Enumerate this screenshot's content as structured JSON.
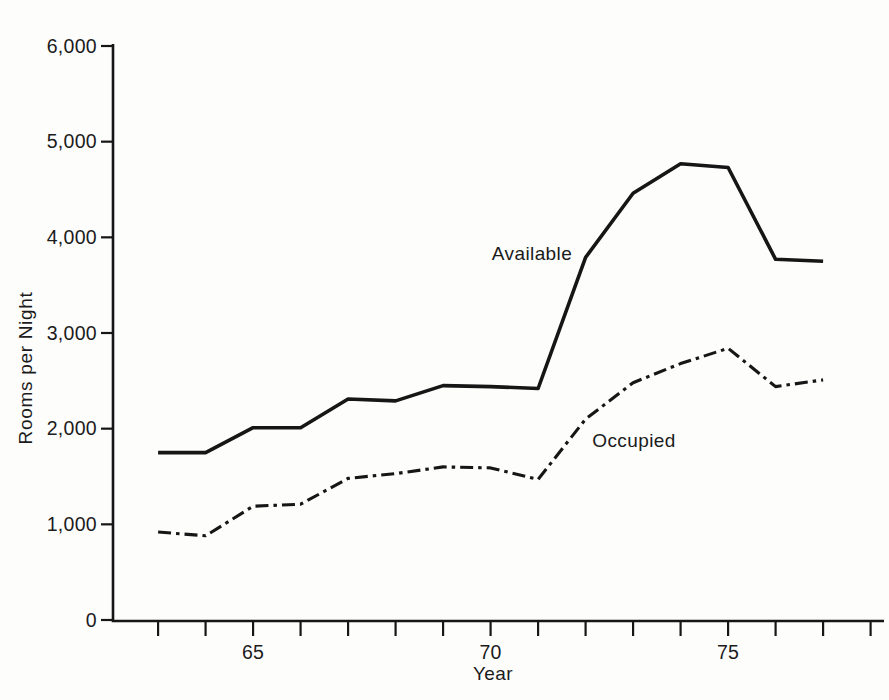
{
  "chart_data": {
    "type": "line",
    "xlabel": "Year",
    "ylabel": "Rooms per Night",
    "x": [
      63,
      64,
      65,
      66,
      67,
      68,
      69,
      70,
      71,
      72,
      73,
      74,
      75,
      76,
      77
    ],
    "series": [
      {
        "name": "Available",
        "style": "solid",
        "values": [
          1750,
          1750,
          2010,
          2010,
          2310,
          2290,
          2450,
          2440,
          2420,
          3790,
          4460,
          4770,
          4730,
          3770,
          3750
        ]
      },
      {
        "name": "Occupied",
        "style": "dash-dot",
        "values": [
          920,
          880,
          1190,
          1210,
          1480,
          1530,
          1600,
          1590,
          1470,
          2100,
          2480,
          2680,
          2840,
          2440,
          2510
        ]
      }
    ],
    "ylim": [
      0,
      6000
    ],
    "xlim": [
      62,
      78.3
    ],
    "yticks": [
      0,
      1000,
      2000,
      3000,
      4000,
      5000,
      6000
    ],
    "ytick_labels": [
      "0",
      "1,000",
      "2,000",
      "3,000",
      "4,000",
      "5,000",
      "6,000"
    ],
    "xticks": [
      63,
      64,
      65,
      66,
      67,
      68,
      69,
      70,
      71,
      72,
      73,
      74,
      75,
      76,
      77,
      78
    ],
    "xtick_labels": {
      "65": "65",
      "70": "70",
      "75": "75"
    },
    "annotations": [
      {
        "text": "Available"
      },
      {
        "text": "Occupied"
      }
    ],
    "grid": false,
    "legend_position": "inline-annotations",
    "line_color": "#161616",
    "text_color": "#1b1b1b",
    "background": "#fdfdfc"
  }
}
